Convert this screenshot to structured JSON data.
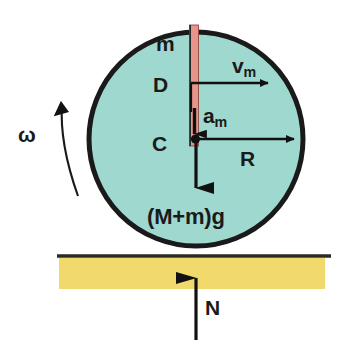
{
  "figure": {
    "background_color": "#ffffff"
  },
  "colors": {
    "disc_fill": "#9ed8cf",
    "disc_outline": "#1a1a1a",
    "rod_fill": "#e8948a",
    "rod_outline": "#1a1a1a",
    "ground_band": "#f2d96b",
    "ground_line": "#2b2b22",
    "arrow": "#111111",
    "text": "#1a1a1a"
  },
  "labels": {
    "mass_rod": "m",
    "rod_length": "D",
    "center": "C",
    "velocity": "v",
    "velocity_sub": "m",
    "acceleration": "a",
    "acceleration_sub": "m",
    "radius": "R",
    "weight": "(M+m)g",
    "angular_velocity": "ω",
    "normal_force": "N"
  },
  "geometry": {
    "disc": {
      "cx": 196,
      "cy": 139,
      "r": 108,
      "stroke_width": 5
    },
    "rod": {
      "x": 189,
      "y_top": 25,
      "y_bottom": 146,
      "width": 9
    },
    "ground": {
      "line_x1": 57,
      "line_x2": 331,
      "line_y": 256,
      "line_width": 3,
      "band_x": 59,
      "band_y": 258,
      "band_w": 266,
      "band_h": 31
    },
    "arrows": {
      "velocity": {
        "x1": 196,
        "y1": 83,
        "x2": 276,
        "y2": 83,
        "dir": "right"
      },
      "acceleration": {
        "x1": 196,
        "y1": 110,
        "x2": 196,
        "y2": 147,
        "dir": "down"
      },
      "radius": {
        "x1": 196,
        "y1": 139,
        "x2": 301,
        "y2": 139,
        "dir": "right"
      },
      "weight": {
        "x1": 196,
        "y1": 139,
        "x2": 196,
        "y2": 207,
        "dir": "down"
      },
      "normal": {
        "x1": 196,
        "y1": 340,
        "x2": 196,
        "y2": 257,
        "dir": "up"
      },
      "omega": {
        "type": "curved-ccw",
        "start_x": 76,
        "start_y": 195,
        "end_x": 64,
        "end_y": 92
      }
    }
  },
  "semantics": {
    "type": "physics free-body diagram",
    "description": "A rolling disc of radius R on a horizontal surface with a thin rod of mass m and length D embedded vertically from the rim to the center C, rotating with angular velocity omega."
  }
}
